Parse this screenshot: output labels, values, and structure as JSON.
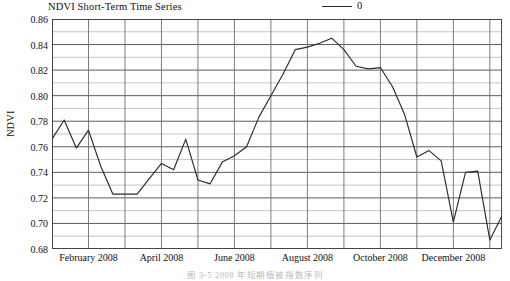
{
  "figure": {
    "title": "NDVI Short-Term Time Series",
    "y_axis_label": "NDVI",
    "caption": "图 3-5  2008 年短期植被指数序列"
  },
  "legend": {
    "entries": [
      {
        "label": "0",
        "color": "#2b2b2b",
        "marker": "line-swatch"
      }
    ]
  },
  "chart_data": {
    "type": "line",
    "title": "NDVI Short-Term Time Series",
    "xlabel": "",
    "ylabel": "NDVI",
    "ylim": [
      0.68,
      0.86
    ],
    "ytick_step": 0.02,
    "yticks": [
      "0.68",
      "0.70",
      "0.72",
      "0.74",
      "0.76",
      "0.78",
      "0.80",
      "0.82",
      "0.84",
      "0.86"
    ],
    "ytick_values": [
      0.68,
      0.7,
      0.72,
      0.74,
      0.76,
      0.78,
      0.8,
      0.82,
      0.84,
      0.86
    ],
    "minor_gridlines": true,
    "minor_gridline_step": 0.01,
    "xticks": [
      "February 2008",
      "April 2008",
      "June 2008",
      "August 2008",
      "October 2008",
      "December 2008"
    ],
    "xtick_positions": [
      3,
      9,
      15,
      21,
      27,
      33
    ],
    "xlim": [
      0,
      37
    ],
    "vertical_gridline_interval": 3,
    "grid": true,
    "legend_position": "top-right",
    "series": [
      {
        "name": "0",
        "color": "#2b2b2b",
        "x": [
          0,
          1,
          2,
          3,
          4,
          5,
          6,
          7,
          8,
          9,
          10,
          11,
          12,
          13,
          14,
          15,
          16,
          17,
          18,
          19,
          20,
          21,
          22,
          23,
          24,
          25,
          26,
          27,
          28,
          29,
          30,
          31,
          32,
          33,
          34,
          35,
          36,
          37
        ],
        "values": [
          0.766,
          0.781,
          0.759,
          0.773,
          0.745,
          0.723,
          0.723,
          0.723,
          0.735,
          0.747,
          0.742,
          0.766,
          0.734,
          0.731,
          0.748,
          0.753,
          0.76,
          0.783,
          0.8,
          0.817,
          0.836,
          0.838,
          0.841,
          0.845,
          0.836,
          0.823,
          0.821,
          0.822,
          0.807,
          0.785,
          0.752,
          0.757,
          0.749,
          0.701,
          0.74,
          0.741,
          0.687,
          0.706
        ]
      }
    ],
    "series_tail": {
      "note": "continuation of the same single series across the remaining months",
      "x": [
        38,
        39,
        40,
        41,
        42,
        43,
        44,
        45,
        46
      ],
      "values": [
        0.709,
        0.711,
        0.758,
        0.792,
        0.722,
        0.764,
        0.806,
        0.772,
        0.78
      ]
    }
  }
}
